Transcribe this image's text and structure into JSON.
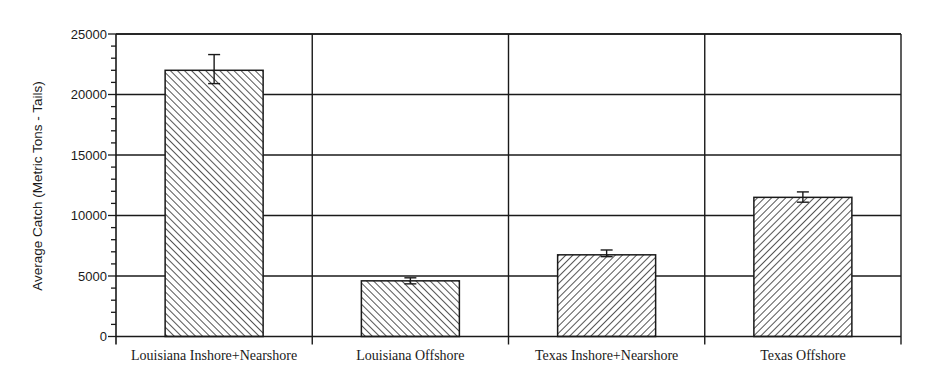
{
  "chart_data": {
    "type": "bar",
    "title": "",
    "xlabel": "",
    "ylabel": "Average Catch (Metric Tons - Tails)",
    "categories": [
      "Louisiana Inshore+Nearshore",
      "Louisiana Offshore",
      "Texas Inshore+Nearshore",
      "Texas Offshore"
    ],
    "values": [
      22000,
      4600,
      6750,
      11500
    ],
    "error_bars": [
      {
        "low": 20900,
        "high": 23300
      },
      {
        "low": 4350,
        "high": 4850
      },
      {
        "low": 6600,
        "high": 7150
      },
      {
        "low": 11100,
        "high": 11950
      }
    ],
    "bar_patterns": [
      "hatch-backslash",
      "hatch-backslash",
      "hatch-slash",
      "hatch-slash"
    ],
    "ylim": [
      0,
      25000
    ],
    "yticks": [
      0,
      5000,
      10000,
      15000,
      20000,
      25000
    ],
    "ytick_labels": [
      "0",
      "5000",
      "10000",
      "15000",
      "20000",
      "25000"
    ],
    "y_minor_tick_step": 1000,
    "grid": {
      "horizontal": true,
      "vertical_category_separators": true
    },
    "legend": null,
    "colors": {
      "axis": "#1a1a1a",
      "bar_fill": "#ffffff",
      "hatch": "#2a2a2a",
      "background": "#ffffff"
    }
  }
}
